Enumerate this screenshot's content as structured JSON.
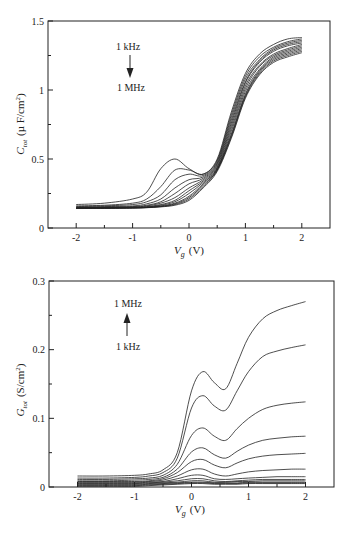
{
  "chart_data": [
    {
      "type": "line",
      "title": "",
      "xlabel": "V_g (V)",
      "xlabel_main": "V",
      "xlabel_sub": "g",
      "xlabel_unit": "(V)",
      "ylabel": "C_tot (µF/cm²)",
      "ylabel_main": "C",
      "ylabel_sub": "tot",
      "ylabel_unit_pre": "(µ F/cm",
      "ylabel_unit_sup": "2",
      "ylabel_unit_post": ")",
      "xlim": [
        -2.5,
        2.5
      ],
      "ylim": [
        0,
        1.5
      ],
      "xticks": [
        -2,
        -1,
        0,
        1,
        2
      ],
      "xtick_labels": [
        "-2",
        "-1",
        "0",
        "1",
        "2"
      ],
      "xminor": [
        -1.5,
        -0.5,
        0.5,
        1.5
      ],
      "yticks": [
        0,
        0.5,
        1,
        1.5
      ],
      "ytick_labels": [
        "0",
        "0.5",
        "1",
        "1.5"
      ],
      "yminor": [
        0.25,
        0.75,
        1.25
      ],
      "grid": false,
      "annotation": {
        "top": "1 kHz",
        "bottom": "1 MHz",
        "arrow": "down"
      },
      "x": [
        -2,
        -1.5,
        -1,
        -0.75,
        -0.5,
        -0.25,
        0,
        0.25,
        0.5,
        0.75,
        1,
        1.25,
        1.5,
        1.75,
        2
      ],
      "series": [
        {
          "name": "1 kHz",
          "values": [
            0.17,
            0.18,
            0.21,
            0.26,
            0.43,
            0.5,
            0.43,
            0.39,
            0.5,
            0.84,
            1.12,
            1.26,
            1.33,
            1.37,
            1.38
          ]
        },
        {
          "name": "f2",
          "values": [
            0.16,
            0.165,
            0.18,
            0.21,
            0.3,
            0.42,
            0.42,
            0.39,
            0.49,
            0.82,
            1.1,
            1.24,
            1.31,
            1.35,
            1.37
          ]
        },
        {
          "name": "f3",
          "values": [
            0.155,
            0.16,
            0.17,
            0.19,
            0.24,
            0.35,
            0.39,
            0.38,
            0.48,
            0.8,
            1.08,
            1.22,
            1.3,
            1.34,
            1.36
          ]
        },
        {
          "name": "f4",
          "values": [
            0.15,
            0.155,
            0.16,
            0.175,
            0.21,
            0.29,
            0.35,
            0.37,
            0.47,
            0.78,
            1.06,
            1.21,
            1.29,
            1.33,
            1.35
          ]
        },
        {
          "name": "f5",
          "values": [
            0.15,
            0.15,
            0.155,
            0.165,
            0.19,
            0.25,
            0.32,
            0.36,
            0.46,
            0.76,
            1.05,
            1.2,
            1.28,
            1.32,
            1.34
          ]
        },
        {
          "name": "f6",
          "values": [
            0.145,
            0.15,
            0.152,
            0.16,
            0.18,
            0.22,
            0.29,
            0.35,
            0.45,
            0.74,
            1.03,
            1.18,
            1.26,
            1.3,
            1.33
          ]
        },
        {
          "name": "f7",
          "values": [
            0.145,
            0.148,
            0.15,
            0.155,
            0.17,
            0.2,
            0.27,
            0.34,
            0.44,
            0.72,
            1.01,
            1.17,
            1.25,
            1.29,
            1.32
          ]
        },
        {
          "name": "f8",
          "values": [
            0.145,
            0.146,
            0.148,
            0.152,
            0.165,
            0.19,
            0.25,
            0.33,
            0.43,
            0.7,
            0.99,
            1.15,
            1.24,
            1.28,
            1.31
          ]
        },
        {
          "name": "f9",
          "values": [
            0.143,
            0.145,
            0.147,
            0.15,
            0.16,
            0.18,
            0.23,
            0.32,
            0.43,
            0.68,
            0.97,
            1.14,
            1.23,
            1.27,
            1.3
          ]
        },
        {
          "name": "f10",
          "values": [
            0.142,
            0.144,
            0.146,
            0.149,
            0.157,
            0.175,
            0.22,
            0.31,
            0.42,
            0.67,
            0.96,
            1.13,
            1.22,
            1.26,
            1.29
          ]
        },
        {
          "name": "f11",
          "values": [
            0.142,
            0.143,
            0.145,
            0.148,
            0.155,
            0.17,
            0.21,
            0.3,
            0.42,
            0.66,
            0.95,
            1.12,
            1.21,
            1.25,
            1.28
          ]
        },
        {
          "name": "1 MHz",
          "values": [
            0.141,
            0.142,
            0.144,
            0.147,
            0.153,
            0.165,
            0.2,
            0.29,
            0.41,
            0.65,
            0.94,
            1.11,
            1.2,
            1.24,
            1.27
          ]
        }
      ]
    },
    {
      "type": "line",
      "title": "",
      "xlabel": "V_g (V)",
      "xlabel_main": "V",
      "xlabel_sub": "g",
      "xlabel_unit": "(V)",
      "ylabel": "G_tot (S/cm²)",
      "ylabel_main": "G",
      "ylabel_sub": "tot",
      "ylabel_unit_pre": "(S/cm",
      "ylabel_unit_sup": "2",
      "ylabel_unit_post": ")",
      "xlim": [
        -2.5,
        2.5
      ],
      "ylim": [
        0,
        0.3
      ],
      "xticks": [
        -2,
        -1,
        0,
        1,
        2
      ],
      "xtick_labels": [
        "-2",
        "-1",
        "0",
        "1",
        "2"
      ],
      "xminor": [
        -1.5,
        -0.5,
        0.5,
        1.5
      ],
      "yticks": [
        0,
        0.1,
        0.2,
        0.3
      ],
      "ytick_labels": [
        "0",
        "0.1",
        "0.2",
        "0.3"
      ],
      "yminor": [
        0.05,
        0.15,
        0.25
      ],
      "grid": false,
      "annotation": {
        "top": "1 MHz",
        "bottom": "1 kHz",
        "arrow": "up"
      },
      "x": [
        -2,
        -1.5,
        -1,
        -0.75,
        -0.5,
        -0.25,
        0,
        0.2,
        0.4,
        0.6,
        0.8,
        1,
        1.25,
        1.5,
        1.75,
        2
      ],
      "series": [
        {
          "name": "1 MHz",
          "values": [
            0.016,
            0.016,
            0.017,
            0.019,
            0.025,
            0.05,
            0.14,
            0.168,
            0.152,
            0.143,
            0.18,
            0.218,
            0.245,
            0.257,
            0.264,
            0.27
          ]
        },
        {
          "name": "f11",
          "values": [
            0.013,
            0.013,
            0.014,
            0.016,
            0.021,
            0.042,
            0.115,
            0.133,
            0.118,
            0.112,
            0.14,
            0.168,
            0.19,
            0.198,
            0.203,
            0.207
          ]
        },
        {
          "name": "f10",
          "values": [
            0.011,
            0.011,
            0.012,
            0.013,
            0.017,
            0.033,
            0.075,
            0.086,
            0.074,
            0.068,
            0.085,
            0.1,
            0.113,
            0.119,
            0.122,
            0.124
          ]
        },
        {
          "name": "f9",
          "values": [
            0.009,
            0.009,
            0.01,
            0.011,
            0.014,
            0.026,
            0.051,
            0.057,
            0.047,
            0.042,
            0.052,
            0.061,
            0.068,
            0.071,
            0.073,
            0.074
          ]
        },
        {
          "name": "f8",
          "values": [
            0.008,
            0.008,
            0.008,
            0.009,
            0.012,
            0.021,
            0.037,
            0.04,
            0.032,
            0.028,
            0.035,
            0.041,
            0.045,
            0.047,
            0.048,
            0.049
          ]
        },
        {
          "name": "f7",
          "values": [
            0.007,
            0.007,
            0.007,
            0.008,
            0.01,
            0.016,
            0.025,
            0.026,
            0.019,
            0.016,
            0.019,
            0.022,
            0.024,
            0.025,
            0.026,
            0.026
          ]
        },
        {
          "name": "f6",
          "values": [
            0.006,
            0.006,
            0.006,
            0.007,
            0.008,
            0.012,
            0.017,
            0.017,
            0.012,
            0.011,
            0.012,
            0.013,
            0.014,
            0.015,
            0.015,
            0.015
          ]
        },
        {
          "name": "f5",
          "values": [
            0.005,
            0.005,
            0.005,
            0.006,
            0.007,
            0.009,
            0.012,
            0.012,
            0.009,
            0.008,
            0.009,
            0.01,
            0.011,
            0.011,
            0.011,
            0.011
          ]
        },
        {
          "name": "f4",
          "values": [
            0.004,
            0.004,
            0.004,
            0.005,
            0.006,
            0.007,
            0.009,
            0.009,
            0.007,
            0.007,
            0.008,
            0.008,
            0.009,
            0.009,
            0.009,
            0.009
          ]
        },
        {
          "name": "f3",
          "values": [
            0.003,
            0.003,
            0.003,
            0.004,
            0.005,
            0.006,
            0.007,
            0.007,
            0.006,
            0.006,
            0.006,
            0.007,
            0.007,
            0.007,
            0.007,
            0.007
          ]
        },
        {
          "name": "f2",
          "values": [
            0.002,
            0.002,
            0.002,
            0.003,
            0.004,
            0.005,
            0.006,
            0.006,
            0.005,
            0.005,
            0.005,
            0.006,
            0.006,
            0.006,
            0.006,
            0.006
          ]
        },
        {
          "name": "1 kHz",
          "values": [
            0.001,
            0.001,
            0.001,
            0.002,
            0.003,
            0.004,
            0.005,
            0.005,
            0.004,
            0.004,
            0.004,
            0.005,
            0.005,
            0.005,
            0.005,
            0.005
          ]
        }
      ]
    }
  ]
}
